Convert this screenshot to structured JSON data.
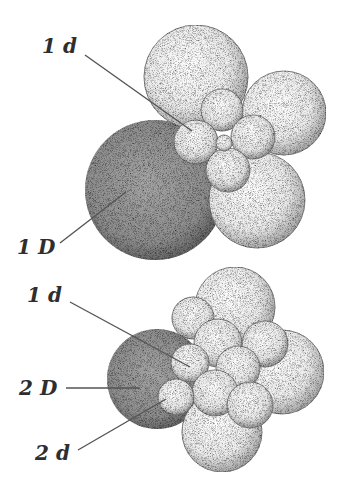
{
  "figure": {
    "top": {
      "labels": [
        {
          "id": "1d",
          "text": "1 d"
        },
        {
          "id": "1D",
          "text": "1 D"
        }
      ]
    },
    "bottom": {
      "labels": [
        {
          "id": "1d",
          "text": "1 d"
        },
        {
          "id": "2D",
          "text": "2 D"
        },
        {
          "id": "2d",
          "text": "2 d"
        }
      ]
    }
  },
  "colors": {
    "macromere_dark": "#8a8a8a",
    "micromere_light": "#f4f4f4",
    "stipple": "#3c3c3c",
    "label": "#2e2e2e"
  }
}
